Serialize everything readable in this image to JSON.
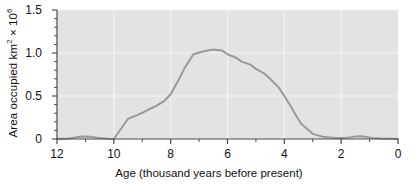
{
  "chart_data": {
    "type": "line",
    "title": "",
    "xlabel": "Age (thousand years before present)",
    "ylabel": "Area occupied km2 x 106",
    "ylabel_parts": {
      "prefix": "Area occupied km",
      "sup1": "2",
      "mid": " × 10",
      "sup2": "6"
    },
    "xlim": [
      12,
      0
    ],
    "ylim": [
      0,
      1.5
    ],
    "x_reversed": true,
    "grid": true,
    "grid_color": "#f4f4f4",
    "plot_bg": "#e3e3e3",
    "line_color": "#9a9a9a",
    "line_width": 2.0,
    "legend": null,
    "legend_position": "none",
    "xticks": [
      12,
      10,
      8,
      6,
      4,
      2,
      0
    ],
    "xtick_labels": [
      "12",
      "10",
      "8",
      "6",
      "4",
      "2",
      "0"
    ],
    "x_minor_ticks": [
      11,
      9,
      7,
      5,
      3,
      1
    ],
    "yticks": [
      0,
      0.5,
      1.0,
      1.5
    ],
    "ytick_labels": [
      "0",
      "0.5",
      "1.0",
      "1.5"
    ],
    "y_minor_ticks": [
      0.1,
      0.2,
      0.3,
      0.4,
      0.6,
      0.7,
      0.8,
      0.9,
      1.1,
      1.2,
      1.3,
      1.4
    ],
    "x": [
      12.0,
      11.6,
      11.4,
      11.2,
      11.0,
      10.8,
      10.6,
      10.4,
      10.2,
      10.0,
      9.5,
      9.2,
      9.0,
      8.7,
      8.5,
      8.2,
      8.0,
      7.7,
      7.5,
      7.2,
      7.0,
      6.7,
      6.5,
      6.2,
      6.0,
      5.7,
      5.5,
      5.2,
      5.0,
      4.7,
      4.5,
      4.2,
      4.0,
      3.8,
      3.6,
      3.4,
      3.0,
      2.6,
      2.2,
      1.9,
      1.7,
      1.5,
      1.3,
      1.1,
      0.9,
      0.6,
      0.3,
      0.0
    ],
    "y": [
      0.0,
      0.005,
      0.015,
      0.026,
      0.03,
      0.026,
      0.016,
      0.008,
      0.003,
      0.0,
      0.235,
      0.275,
      0.305,
      0.355,
      0.385,
      0.45,
      0.52,
      0.7,
      0.83,
      0.985,
      1.005,
      1.03,
      1.04,
      1.03,
      0.985,
      0.945,
      0.9,
      0.865,
      0.815,
      0.76,
      0.7,
      0.6,
      0.5,
      0.395,
      0.28,
      0.175,
      0.06,
      0.022,
      0.012,
      0.012,
      0.018,
      0.03,
      0.033,
      0.024,
      0.012,
      0.005,
      0.002,
      0.0
    ],
    "annotations": [
      {
        "text": "small early bump near 11 ka",
        "x": 11.0,
        "y": 0.03
      },
      {
        "text": "plateau peak near 7-6.5 ka",
        "x": 6.6,
        "y": 1.04
      },
      {
        "text": "small late bump near 1.3 ka",
        "x": 1.3,
        "y": 0.033
      }
    ]
  },
  "geometry": {
    "plot_left": 57,
    "plot_right": 398,
    "plot_top": 10,
    "plot_bottom": 139
  }
}
